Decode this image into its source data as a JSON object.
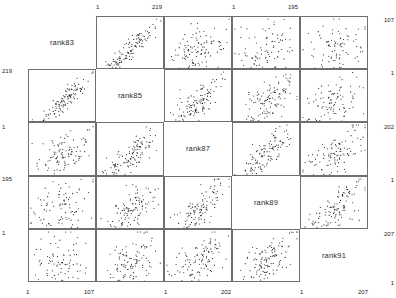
{
  "chart_data": {
    "type": "scatter",
    "title": "",
    "subtitle": "",
    "xlabel": "",
    "ylabel": "",
    "grid": false,
    "legend": "none",
    "matrix": true,
    "variables": [
      "rank83",
      "rank85",
      "rank87",
      "rank89",
      "rank91"
    ],
    "variable_ranges": [
      {
        "name": "rank83",
        "min": 1,
        "max": 219
      },
      {
        "name": "rank85",
        "min": 1,
        "max": 195
      },
      {
        "name": "rank87",
        "min": 1,
        "max": 107
      },
      {
        "name": "rank89",
        "min": 1,
        "max": 202
      },
      {
        "name": "rank91",
        "min": 1,
        "max": 207
      }
    ],
    "axes": {
      "top": [
        {
          "column": 1,
          "variable": "rank85",
          "ticks": [
            "1",
            "219"
          ]
        },
        {
          "column": 3,
          "variable": "rank89",
          "ticks": [
            "1",
            "195"
          ]
        }
      ],
      "bottom": [
        {
          "column": 0,
          "variable": "rank83",
          "ticks": [
            "1",
            "107"
          ]
        },
        {
          "column": 2,
          "variable": "rank87",
          "ticks": [
            "1",
            "202"
          ]
        },
        {
          "column": 4,
          "variable": "rank91",
          "ticks": [
            "1",
            "207"
          ]
        }
      ],
      "left": [
        {
          "row": 1,
          "variable": "rank85",
          "ticks": [
            "219",
            "1"
          ]
        },
        {
          "row": 3,
          "variable": "rank89",
          "ticks": [
            "195",
            "1"
          ]
        }
      ],
      "right": [
        {
          "row": 0,
          "variable": "rank83",
          "ticks": [
            "107",
            "1"
          ]
        },
        {
          "row": 2,
          "variable": "rank87",
          "ticks": [
            "202",
            "1"
          ]
        },
        {
          "row": 4,
          "variable": "rank91",
          "ticks": [
            "207",
            "1"
          ]
        }
      ]
    },
    "panels": [
      {
        "row": 0,
        "col": 1,
        "x": "rank85",
        "y": "rank83",
        "n": 120,
        "correlation": 0.92,
        "pattern": "strong-positive"
      },
      {
        "row": 0,
        "col": 2,
        "x": "rank87",
        "y": "rank83",
        "n": 110,
        "correlation": 0.52,
        "pattern": "moderate-positive"
      },
      {
        "row": 0,
        "col": 3,
        "x": "rank89",
        "y": "rank83",
        "n": 95,
        "correlation": 0.18,
        "pattern": "weak-positive"
      },
      {
        "row": 0,
        "col": 4,
        "x": "rank91",
        "y": "rank83",
        "n": 90,
        "correlation": 0.1,
        "pattern": "scatter-cloud"
      },
      {
        "row": 1,
        "col": 0,
        "x": "rank83",
        "y": "rank85",
        "n": 120,
        "correlation": 0.92,
        "pattern": "strong-positive"
      },
      {
        "row": 1,
        "col": 2,
        "x": "rank87",
        "y": "rank85",
        "n": 120,
        "correlation": 0.8,
        "pattern": "strong-positive"
      },
      {
        "row": 1,
        "col": 3,
        "x": "rank89",
        "y": "rank85",
        "n": 115,
        "correlation": 0.62,
        "pattern": "moderate-positive"
      },
      {
        "row": 1,
        "col": 4,
        "x": "rank91",
        "y": "rank85",
        "n": 100,
        "correlation": 0.45,
        "pattern": "moderate-positive"
      },
      {
        "row": 2,
        "col": 0,
        "x": "rank83",
        "y": "rank87",
        "n": 110,
        "correlation": 0.5,
        "pattern": "moderate-positive"
      },
      {
        "row": 2,
        "col": 1,
        "x": "rank85",
        "y": "rank87",
        "n": 125,
        "correlation": 0.82,
        "pattern": "strong-positive"
      },
      {
        "row": 2,
        "col": 3,
        "x": "rank89",
        "y": "rank87",
        "n": 120,
        "correlation": 0.78,
        "pattern": "strong-positive"
      },
      {
        "row": 2,
        "col": 4,
        "x": "rank91",
        "y": "rank87",
        "n": 110,
        "correlation": 0.6,
        "pattern": "moderate-positive"
      },
      {
        "row": 3,
        "col": 0,
        "x": "rank83",
        "y": "rank89",
        "n": 95,
        "correlation": 0.32,
        "pattern": "weak-positive"
      },
      {
        "row": 3,
        "col": 1,
        "x": "rank85",
        "y": "rank89",
        "n": 120,
        "correlation": 0.7,
        "pattern": "strong-positive"
      },
      {
        "row": 3,
        "col": 2,
        "x": "rank87",
        "y": "rank89",
        "n": 120,
        "correlation": 0.72,
        "pattern": "strong-positive"
      },
      {
        "row": 3,
        "col": 4,
        "x": "rank91",
        "y": "rank89",
        "n": 120,
        "correlation": 0.75,
        "pattern": "strong-positive"
      },
      {
        "row": 4,
        "col": 0,
        "x": "rank83",
        "y": "rank91",
        "n": 85,
        "correlation": 0.08,
        "pattern": "scatter-cloud"
      },
      {
        "row": 4,
        "col": 1,
        "x": "rank85",
        "y": "rank91",
        "n": 110,
        "correlation": 0.55,
        "pattern": "moderate-positive"
      },
      {
        "row": 4,
        "col": 2,
        "x": "rank87",
        "y": "rank91",
        "n": 115,
        "correlation": 0.62,
        "pattern": "moderate-positive"
      },
      {
        "row": 4,
        "col": 3,
        "x": "rank89",
        "y": "rank91",
        "n": 120,
        "correlation": 0.76,
        "pattern": "strong-positive"
      }
    ]
  },
  "diagonal": {
    "labels": [
      "rank83",
      "rank85",
      "rank87",
      "rank89",
      "rank91"
    ]
  },
  "ticks": {
    "top_c1_left": "1",
    "top_c1_right": "219",
    "top_c3_left": "1",
    "top_c3_right": "195",
    "bottom_c0_left": "1",
    "bottom_c0_right": "107",
    "bottom_c2_left": "1",
    "bottom_c2_right": "202",
    "bottom_c4_left": "1",
    "bottom_c4_right": "207",
    "left_r1_top": "219",
    "left_r1_bottom": "1",
    "left_r3_top": "195",
    "left_r3_bottom": "1",
    "right_r0_top": "107",
    "right_r0_bottom": "1",
    "right_r2_top": "202",
    "right_r2_bottom": "1",
    "right_r4_top": "207",
    "right_r4_bottom": "1"
  }
}
